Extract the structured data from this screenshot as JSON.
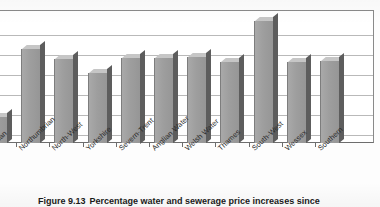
{
  "chart_data": {
    "type": "bar",
    "title": "",
    "xlabel": "",
    "ylabel": "",
    "grid": true,
    "legend": "none",
    "ylim": [
      0,
      140
    ],
    "gridline_values": [
      140,
      120,
      100,
      80,
      60,
      40,
      20
    ],
    "categories": [
      "Anglian",
      "Northumbrian",
      "North-West",
      "Yorkshire",
      "Severn-Trent",
      "Anglian Water",
      "Welsh Water",
      "Thames",
      "South-West",
      "Wessex",
      "Southern"
    ],
    "values": [
      27,
      99,
      88,
      74,
      90,
      89,
      91,
      85,
      128,
      85,
      86
    ],
    "bar_color": "#9e9e9e",
    "bar_side_color": "#5d5d5d",
    "bar_top_color": "#c6c6c6",
    "gridline_color": "#b9b9b9",
    "axis_color": "#6d6d6d",
    "first_bar_clipped": true
  },
  "caption": {
    "number": "Figure 9.13",
    "text": "Percentage water and sewerage price increases since"
  },
  "axis": {
    "tick_marks": 11
  }
}
